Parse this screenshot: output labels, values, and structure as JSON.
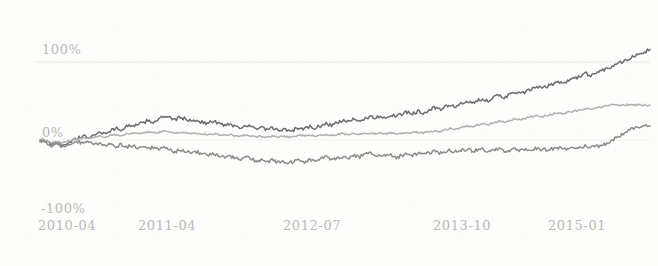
{
  "chart_data": {
    "type": "line",
    "title": "",
    "subtitle": "",
    "xlabel": "",
    "ylabel": "",
    "grid": true,
    "grid_lines_at": [
      100,
      0
    ],
    "legend": "none",
    "ylim": [
      -100,
      150
    ],
    "yticks": [
      100,
      0,
      -100
    ],
    "ytick_labels": [
      "100%",
      "0%",
      "-100%"
    ],
    "xticks": [
      "2010-04",
      "2011-04",
      "2012-07",
      "2013-10",
      "2015-01"
    ],
    "xtick_positions_px": [
      40,
      140,
      285,
      435,
      550
    ],
    "x_range": [
      "2010-04",
      "2015-06"
    ],
    "series": [
      {
        "name": "series-1",
        "color": "#6e6e6e",
        "values": [
          0,
          -2,
          -5,
          -3,
          -6,
          -4,
          -1,
          2,
          5,
          3,
          7,
          10,
          8,
          12,
          15,
          13,
          17,
          20,
          18,
          22,
          25,
          23,
          27,
          30,
          28,
          26,
          29,
          27,
          24,
          26,
          23,
          21,
          24,
          22,
          19,
          21,
          18,
          16,
          19,
          17,
          14,
          16,
          13,
          15,
          12,
          14,
          11,
          13,
          16,
          14,
          17,
          15,
          18,
          21,
          19,
          22,
          25,
          23,
          26,
          24,
          27,
          30,
          28,
          31,
          29,
          32,
          30,
          33,
          36,
          34,
          37,
          35,
          38,
          41,
          39,
          42,
          45,
          43,
          46,
          49,
          47,
          50,
          53,
          51,
          54,
          57,
          55,
          58,
          61,
          59,
          62,
          65,
          68,
          66,
          69,
          72,
          75,
          73,
          76,
          79,
          82,
          85,
          83,
          86,
          89,
          92,
          95,
          98,
          101,
          104,
          107,
          110,
          113,
          116
        ],
        "end_value": 116
      },
      {
        "name": "series-2",
        "color": "#b0b0ae",
        "values": [
          0,
          -1,
          -3,
          -2,
          -4,
          -2,
          0,
          1,
          3,
          2,
          4,
          5,
          4,
          6,
          7,
          6,
          8,
          9,
          8,
          9,
          10,
          9,
          10,
          11,
          10,
          9,
          10,
          9,
          8,
          9,
          8,
          7,
          8,
          7,
          6,
          7,
          6,
          5,
          6,
          5,
          4,
          5,
          4,
          5,
          4,
          5,
          4,
          5,
          6,
          5,
          6,
          5,
          6,
          7,
          6,
          7,
          8,
          7,
          8,
          7,
          8,
          9,
          8,
          9,
          8,
          9,
          8,
          9,
          10,
          9,
          10,
          9,
          10,
          12,
          11,
          13,
          15,
          14,
          16,
          18,
          17,
          19,
          21,
          20,
          22,
          24,
          23,
          25,
          27,
          26,
          28,
          30,
          31,
          30,
          32,
          33,
          35,
          34,
          36,
          37,
          38,
          40,
          39,
          41,
          42,
          44,
          45,
          45,
          45,
          45,
          45,
          45,
          45,
          45
        ],
        "end_value": 45
      },
      {
        "name": "series-3",
        "color": "#8c8c8a",
        "values": [
          0,
          -3,
          -7,
          -5,
          -9,
          -7,
          -4,
          -2,
          -5,
          -3,
          -6,
          -4,
          -7,
          -5,
          -8,
          -6,
          -9,
          -7,
          -10,
          -8,
          -11,
          -9,
          -12,
          -10,
          -13,
          -15,
          -12,
          -14,
          -17,
          -15,
          -18,
          -20,
          -17,
          -19,
          -22,
          -20,
          -23,
          -25,
          -22,
          -24,
          -27,
          -25,
          -28,
          -26,
          -29,
          -27,
          -30,
          -28,
          -26,
          -28,
          -25,
          -27,
          -24,
          -22,
          -25,
          -23,
          -21,
          -23,
          -20,
          -22,
          -19,
          -17,
          -20,
          -18,
          -21,
          -19,
          -22,
          -20,
          -18,
          -20,
          -17,
          -19,
          -17,
          -15,
          -17,
          -15,
          -13,
          -15,
          -13,
          -12,
          -14,
          -13,
          -12,
          -14,
          -13,
          -12,
          -14,
          -13,
          -12,
          -14,
          -13,
          -12,
          -11,
          -13,
          -12,
          -11,
          -10,
          -12,
          -11,
          -10,
          -9,
          -8,
          -10,
          -9,
          -7,
          -4,
          0,
          4,
          8,
          12,
          15,
          17,
          18,
          18
        ],
        "end_value": 18
      }
    ]
  },
  "axes": {
    "y_labels": [
      {
        "text": "100%",
        "top": 42,
        "left": 42
      },
      {
        "text": "0%",
        "top": 125,
        "left": 42
      },
      {
        "text": "-100%",
        "top": 201,
        "left": 41
      }
    ],
    "x_labels": [
      {
        "text": "2010-04",
        "left": 38
      },
      {
        "text": "2011-04",
        "left": 138
      },
      {
        "text": "2012-07",
        "left": 283
      },
      {
        "text": "2013-10",
        "left": 433
      },
      {
        "text": "2015-01",
        "left": 548
      }
    ]
  },
  "style": {
    "background": "#fdfdfc",
    "gridline_color": "#e6e6e3",
    "label_color": "#b9b9b6"
  }
}
